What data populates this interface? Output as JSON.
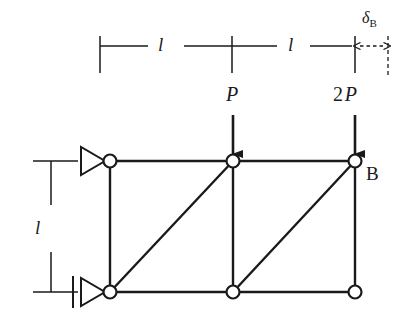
{
  "figure": {
    "background_color": "#ffffff",
    "line_color": "#1a1a1a",
    "node_fill_color": "#ffffff"
  },
  "dimensions": {
    "horizontal_left_label": "l",
    "horizontal_right_label": "l",
    "vertical_label": "l",
    "deflection_symbol": "δ",
    "deflection_subscript": "B"
  },
  "loads": [
    {
      "id": "load-p",
      "magnitude": "",
      "symbol": "P",
      "direction": "down",
      "at_node": "top-middle"
    },
    {
      "id": "load-2p",
      "magnitude": "2",
      "symbol": "P",
      "direction": "down",
      "at_node": "top-right"
    }
  ],
  "nodes": [
    {
      "id": "top-left",
      "label": "",
      "x": 110,
      "y": 161
    },
    {
      "id": "top-middle",
      "label": "",
      "x": 233,
      "y": 161
    },
    {
      "id": "top-right",
      "label": "B",
      "x": 355,
      "y": 161
    },
    {
      "id": "bottom-left",
      "label": "",
      "x": 110,
      "y": 292
    },
    {
      "id": "bottom-middle",
      "label": "",
      "x": 233,
      "y": 292
    },
    {
      "id": "bottom-right",
      "label": "",
      "x": 355,
      "y": 292
    }
  ],
  "members": [
    {
      "id": "top-chord-left",
      "from": "top-left",
      "to": "top-middle"
    },
    {
      "id": "top-chord-right",
      "from": "top-middle",
      "to": "top-right"
    },
    {
      "id": "bottom-chord-left",
      "from": "bottom-left",
      "to": "bottom-middle"
    },
    {
      "id": "bottom-chord-right",
      "from": "bottom-middle",
      "to": "bottom-right"
    },
    {
      "id": "vertical-left",
      "from": "top-left",
      "to": "bottom-left"
    },
    {
      "id": "vertical-middle",
      "from": "top-middle",
      "to": "bottom-middle"
    },
    {
      "id": "vertical-right",
      "from": "top-right",
      "to": "bottom-right"
    },
    {
      "id": "diagonal-left",
      "from": "bottom-left",
      "to": "top-middle"
    },
    {
      "id": "diagonal-right",
      "from": "bottom-middle",
      "to": "top-right"
    }
  ],
  "supports": [
    {
      "id": "support-roller-top-left",
      "type": "roller",
      "at_node": "top-left"
    },
    {
      "id": "support-pin-bottom-left",
      "type": "pin",
      "at_node": "bottom-left"
    }
  ],
  "labels": {
    "node_b": "B"
  }
}
